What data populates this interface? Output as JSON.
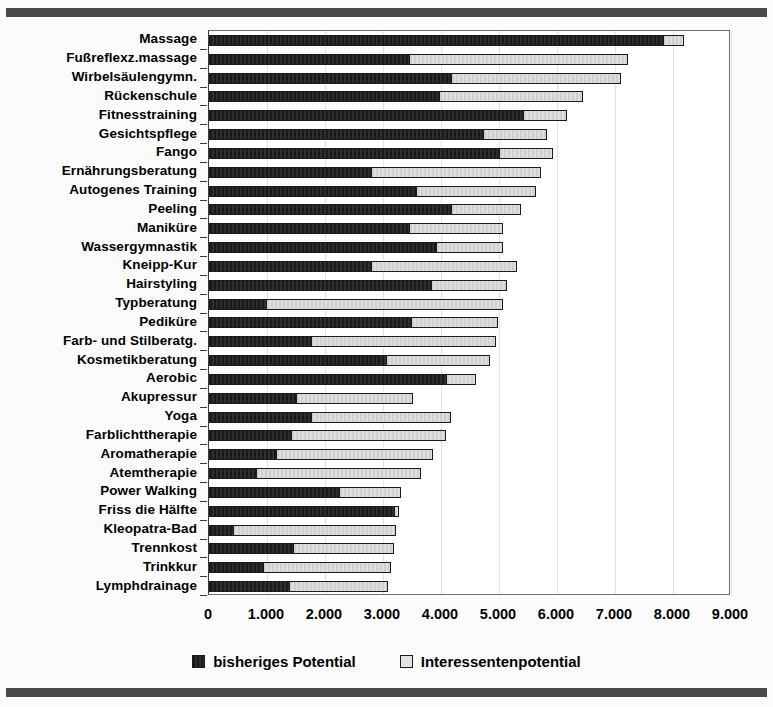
{
  "chart_data": {
    "type": "bar",
    "orientation": "horizontal",
    "stacked": true,
    "title": "",
    "xlabel": "",
    "ylabel": "",
    "xlim": [
      0,
      9000
    ],
    "xticks": [
      0,
      1000,
      2000,
      3000,
      4000,
      5000,
      6000,
      7000,
      8000,
      9000
    ],
    "xticklabels": [
      "0",
      "1.000",
      "2.000",
      "3.000",
      "4.000",
      "5.000",
      "6.000",
      "7.000",
      "8.000",
      "9.000"
    ],
    "grid": "vertical-light",
    "legend_position": "bottom-center",
    "categories": [
      "Massage",
      "Fußreflexz.massage",
      "Wirbelsäulengymn.",
      "Rückenschule",
      "Fitnesstraining",
      "Gesichtspflege",
      "Fango",
      "Ernährungsberatung",
      "Autogenes Training",
      "Peeling",
      "Maniküre",
      "Wassergymnastik",
      "Kneipp-Kur",
      "Hairstyling",
      "Typberatung",
      "Pediküre",
      "Farb- und Stilberatg.",
      "Kosmetikberatung",
      "Aerobic",
      "Akupressur",
      "Yoga",
      "Farblichttherapie",
      "Aromatherapie",
      "Atemtherapie",
      "Power Walking",
      "Friss die Hälfte",
      "Kleopatra-Bad",
      "Trennkost",
      "Trinkkur",
      "Lymphdrainage"
    ],
    "series": [
      {
        "name": "bisheriges Potential",
        "color": "#232323",
        "values": [
          7830,
          3450,
          4170,
          3970,
          5410,
          4720,
          5000,
          2790,
          3570,
          4170,
          3450,
          3910,
          2790,
          3830,
          980,
          3480,
          1760,
          3050,
          4090,
          1500,
          1760,
          1410,
          1150,
          810,
          2240,
          3190,
          410,
          1450,
          930,
          1380
        ]
      },
      {
        "name": "Interessentenpotential",
        "color": "#d4d4d4",
        "values": [
          360,
          3780,
          2930,
          2480,
          760,
          1100,
          930,
          2940,
          2070,
          1210,
          1620,
          1160,
          2520,
          1310,
          4090,
          1500,
          3190,
          1790,
          520,
          2020,
          2410,
          2670,
          2710,
          2840,
          1070,
          90,
          2810,
          1740,
          2210,
          1710
        ]
      }
    ],
    "totals": [
      8190,
      7230,
      7100,
      6450,
      6170,
      5820,
      5930,
      5730,
      5640,
      5380,
      5070,
      5070,
      5310,
      5140,
      5070,
      4980,
      4950,
      4840,
      4610,
      3520,
      4170,
      4080,
      3860,
      3650,
      3310,
      3280,
      3220,
      3190,
      3140,
      3090
    ]
  }
}
